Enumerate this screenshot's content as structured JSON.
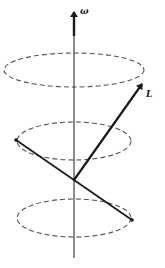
{
  "diagram": {
    "title": "",
    "labels": {
      "angular_velocity": "ω",
      "angular_momentum": "L"
    },
    "elements": [
      {
        "id": "rotation-axis",
        "kind": "vertical axis with arrow",
        "label": "ω"
      },
      {
        "id": "top-orbit",
        "kind": "dashed ellipse"
      },
      {
        "id": "middle-orbit",
        "kind": "dashed ellipse"
      },
      {
        "id": "bottom-orbit",
        "kind": "dashed ellipse"
      },
      {
        "id": "rotating-rod",
        "kind": "tilted rod with two end masses passing through pivot"
      },
      {
        "id": "angular-momentum-vector",
        "kind": "arrow from pivot",
        "label": "L"
      }
    ],
    "colors": {
      "line": "#1a1a1a",
      "dashed": "#555555",
      "background": "#ffffff"
    }
  }
}
